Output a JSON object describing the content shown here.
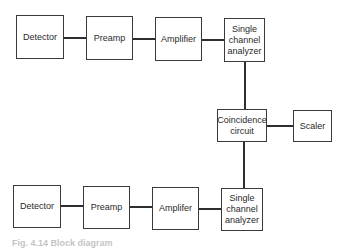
{
  "diagram": {
    "type": "block-diagram",
    "top_chain": [
      {
        "id": "detector_top",
        "label": "Detector"
      },
      {
        "id": "preamp_top",
        "label": "Preamp"
      },
      {
        "id": "amplifier_top",
        "label": "Amplifier"
      },
      {
        "id": "sca_top",
        "label": "Single\nchannel\nanalyzer"
      }
    ],
    "middle": [
      {
        "id": "coincidence",
        "label": "Coincidence\ncircuit"
      },
      {
        "id": "scaler",
        "label": "Scaler"
      }
    ],
    "bottom_chain": [
      {
        "id": "detector_bottom",
        "label": "Detector"
      },
      {
        "id": "preamp_bottom",
        "label": "Preamp"
      },
      {
        "id": "amplifier_bottom",
        "label": "Amplifer"
      },
      {
        "id": "sca_bottom",
        "label": "Single\nchannel\nanalyzer"
      }
    ],
    "connections": [
      [
        "detector_top",
        "preamp_top"
      ],
      [
        "preamp_top",
        "amplifier_top"
      ],
      [
        "amplifier_top",
        "sca_top"
      ],
      [
        "sca_top",
        "coincidence"
      ],
      [
        "coincidence",
        "scaler"
      ],
      [
        "detector_bottom",
        "preamp_bottom"
      ],
      [
        "preamp_bottom",
        "amplifier_bottom"
      ],
      [
        "amplifier_bottom",
        "sca_bottom"
      ],
      [
        "sca_bottom",
        "coincidence"
      ]
    ],
    "caption": "Fig. 4.14  Block diagram"
  }
}
